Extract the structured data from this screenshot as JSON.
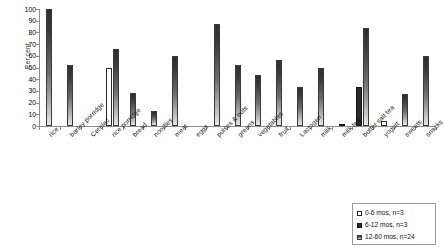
{
  "chart_data": {
    "type": "bar",
    "title": "",
    "xlabel": "",
    "ylabel": "Per cent",
    "ylim": [
      0,
      100
    ],
    "ytick_step": 10,
    "yticks": [
      100,
      90,
      80,
      70,
      60,
      50,
      40,
      30,
      20,
      10,
      0
    ],
    "grid": false,
    "legend_position": "bottom-right",
    "categories": [
      "rice",
      "barley porridge",
      "Cerelac",
      "rice porridge",
      "bread",
      "noodles",
      "meat",
      "eggs",
      "pulses & nuts",
      "greens",
      "vegetables",
      "fruit",
      "Lactogen",
      "milk",
      "milk tea",
      "butter salt tea",
      "yogurt",
      "sweets",
      "snacks"
    ],
    "series": [
      {
        "name": "0-6 mos, n=3",
        "swatch": "s0",
        "color": "#ffffff",
        "values": [
          0,
          0,
          0,
          50,
          0,
          0,
          0,
          0,
          0,
          0,
          0,
          0,
          0,
          0,
          0,
          0,
          4,
          0,
          0
        ]
      },
      {
        "name": "6-12 mos, n=3",
        "swatch": "s1",
        "color": "#2a2a2a",
        "values": [
          0,
          0,
          0,
          0,
          0,
          0,
          0,
          0,
          0,
          0,
          0,
          0,
          0,
          0,
          1,
          33,
          0,
          0,
          0
        ]
      },
      {
        "name": "12-60 mos, n=24",
        "swatch": "s2",
        "color": "#6e6e6e",
        "values": [
          100,
          52,
          0,
          66,
          28,
          13,
          60,
          0,
          87,
          52,
          44,
          56,
          33,
          50,
          0,
          84,
          0,
          27,
          60
        ]
      }
    ]
  },
  "legend": {
    "items": [
      {
        "label": "0-6 mos, n=3",
        "swatch": "s0"
      },
      {
        "label": "6-12 mos, n=3",
        "swatch": "s1"
      },
      {
        "label": "12-60 mos, n=24",
        "swatch": "s2"
      }
    ]
  }
}
